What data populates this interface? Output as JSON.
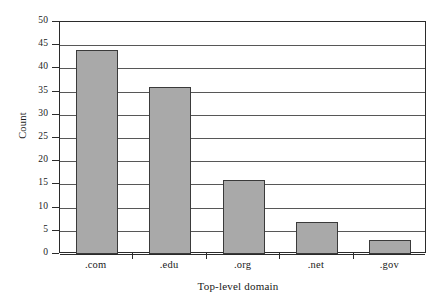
{
  "chart_data": {
    "type": "bar",
    "title": "",
    "xlabel": "Top-level domain",
    "ylabel": "Count",
    "categories": [
      ".com",
      ".edu",
      ".org",
      ".net",
      ".gov"
    ],
    "values": [
      44,
      36,
      16,
      7,
      3
    ],
    "ylim": [
      0,
      50
    ],
    "ytick_labels": [
      "0",
      "5",
      "10",
      "15",
      "20",
      "25",
      "30",
      "35",
      "40",
      "45",
      "50"
    ],
    "ytick_values": [
      0,
      5,
      10,
      15,
      20,
      25,
      30,
      35,
      40,
      45,
      50
    ],
    "grid": "horizontal",
    "legend": "none",
    "bar_color": "#a9a9a9",
    "bar_edge_color": "#3a3a3a",
    "axis_color": "#2b2b2b",
    "grid_color": "#575757",
    "background": "#ffffff"
  }
}
